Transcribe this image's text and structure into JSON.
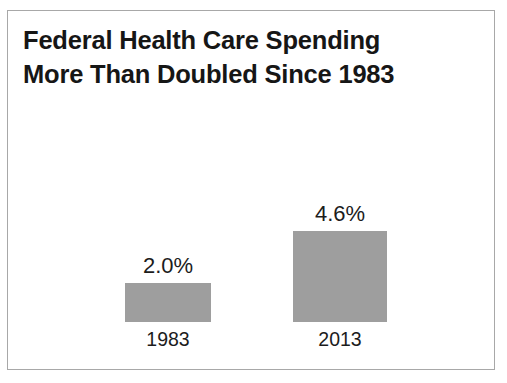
{
  "slide": {
    "background_color": "#ffffff",
    "frame_border_color": "#a8a8a8",
    "title_line_1": "Federal Health Care Spending",
    "title_line_2": "More Than Doubled Since 1983"
  },
  "chart_data": {
    "type": "bar",
    "title": "Federal Health Care Spending More Than Doubled Since 1983",
    "subtitle": "",
    "xlabel": "",
    "ylabel": "",
    "categories": [
      "1983",
      "2013"
    ],
    "values": [
      2.0,
      4.6
    ],
    "value_labels": [
      "2.0%",
      "4.6%"
    ],
    "units": "percent",
    "ylim": [
      0,
      4.6
    ],
    "grid": false,
    "axis_visible": false,
    "legend": false,
    "legend_position": "none",
    "bar_color": "#9e9e9e",
    "label_color": "#1c1c1c",
    "bars": [
      {
        "category": "1983",
        "value": 2.0,
        "value_label": "2.0%",
        "category_label": "1983",
        "color": "#9e9e9e"
      },
      {
        "category": "2013",
        "value": 4.6,
        "value_label": "4.6%",
        "category_label": "2013",
        "color": "#9e9e9e"
      }
    ]
  }
}
